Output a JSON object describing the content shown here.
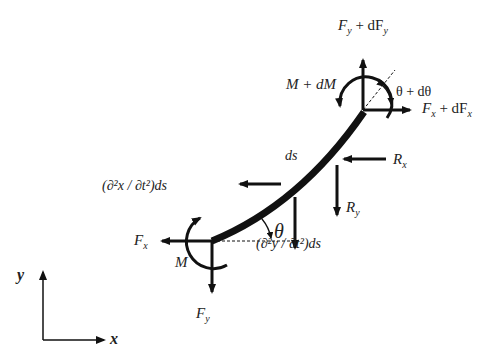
{
  "diagram": {
    "labels": {
      "top_force": "F_y + dF_y",
      "top_force_main": "F",
      "top_force_sub": "y",
      "top_force_plus": " + dF",
      "top_force_sub2": "y",
      "top_moment": "M + dM",
      "top_angle": "θ + dθ",
      "right_force_main": "F",
      "right_force_sub": "x",
      "right_force_plus": " + dF",
      "right_force_sub2": "x",
      "element": "ds",
      "rx_main": "R",
      "rx_sub": "x",
      "ry_main": "R",
      "ry_sub": "y",
      "accel_x": "(∂²x / ∂t²)ds",
      "accel_y": "(∂²y / ∂t²)ds",
      "theta": "θ",
      "bottom_fx_main": "F",
      "bottom_fx_sub": "x",
      "bottom_moment": "M",
      "bottom_fy_main": "F",
      "bottom_fy_sub": "y",
      "axis_x": "x",
      "axis_y": "y"
    },
    "colors": {
      "ink": "#111111",
      "background": "#ffffff"
    }
  }
}
